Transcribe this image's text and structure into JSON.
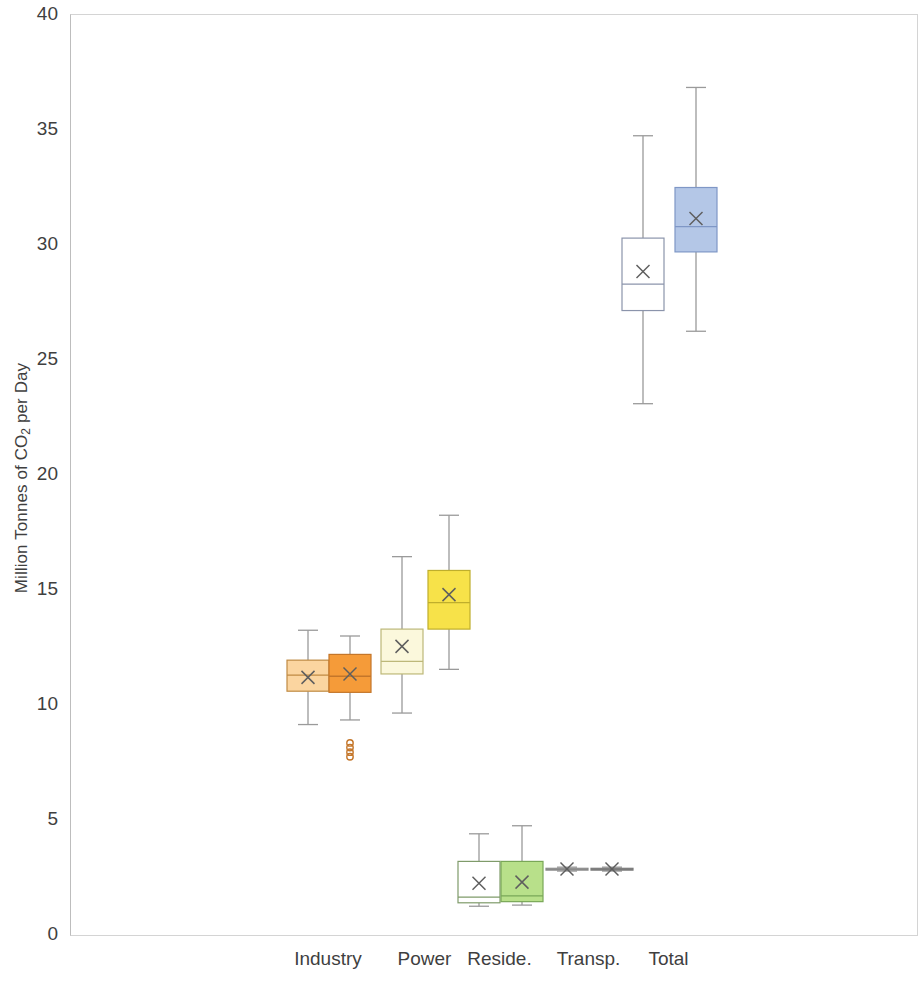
{
  "chart_data": {
    "type": "box",
    "title": "",
    "xlabel": "",
    "ylabel": "Million Tonnes of CO2 per Day",
    "ylabel_parts": {
      "pre": "Million Tonnes of CO",
      "sub": "2",
      "post": " per Day"
    },
    "ylim": [
      0,
      40
    ],
    "ytick_step": 5,
    "yticks": [
      0,
      5,
      10,
      15,
      20,
      25,
      30,
      35,
      40
    ],
    "grid": false,
    "categories": [
      "Industry",
      "Power",
      "Reside.",
      "Transp.",
      "Total"
    ],
    "series": [
      {
        "name": "series-1",
        "color": "#fbd5a0",
        "edge": "#c99a4f"
      },
      {
        "name": "series-2",
        "color": "#f59b39",
        "edge": "#c97b20"
      }
    ],
    "boxes": [
      {
        "category": "Industry",
        "series": 1,
        "fill": "#fbd5a0",
        "edge": "#c08a43",
        "whisker_high": 13.25,
        "q3": 11.95,
        "median": 11.3,
        "mean": 11.2,
        "q1": 10.6,
        "whisker_low": 9.15,
        "outliers": []
      },
      {
        "category": "Industry",
        "series": 2,
        "fill": "#f59b39",
        "edge": "#c4762a",
        "whisker_high": 13.0,
        "q3": 12.2,
        "median": 11.25,
        "mean": 11.35,
        "q1": 10.55,
        "whisker_low": 9.35,
        "outliers": [
          8.35,
          8.15,
          7.95,
          7.75
        ]
      },
      {
        "category": "Power",
        "series": 1,
        "fill": "#fbf8dc",
        "edge": "#bdb879",
        "whisker_high": 16.45,
        "q3": 13.3,
        "median": 11.9,
        "mean": 12.55,
        "q1": 11.35,
        "whisker_low": 9.65,
        "outliers": []
      },
      {
        "category": "Power",
        "series": 2,
        "fill": "#f7e249",
        "edge": "#bfae2c",
        "whisker_high": 18.25,
        "q3": 15.85,
        "median": 14.45,
        "mean": 14.8,
        "q1": 13.3,
        "whisker_low": 11.55,
        "outliers": []
      },
      {
        "category": "Reside.",
        "series": 1,
        "fill": "#ffffff",
        "edge": "#7f9b6a",
        "whisker_high": 4.4,
        "q3": 3.2,
        "median": 1.65,
        "mean": 2.25,
        "q1": 1.4,
        "whisker_low": 1.25,
        "outliers": []
      },
      {
        "category": "Reside.",
        "series": 2,
        "fill": "#b8e08a",
        "edge": "#79a757",
        "whisker_high": 4.75,
        "q3": 3.2,
        "median": 1.7,
        "mean": 2.3,
        "q1": 1.45,
        "whisker_low": 1.3,
        "outliers": []
      },
      {
        "category": "Transp.",
        "series": 1,
        "fill": "#ffffff",
        "edge": "#8a8a8a",
        "whisker_high": 2.95,
        "q3": 2.9,
        "median": 2.85,
        "mean": 2.87,
        "q1": 2.82,
        "whisker_low": 2.78,
        "outliers": []
      },
      {
        "category": "Transp.",
        "series": 2,
        "fill": "#9c9c9c",
        "edge": "#7b7b7b",
        "whisker_high": 2.95,
        "q3": 2.9,
        "median": 2.85,
        "mean": 2.87,
        "q1": 2.82,
        "whisker_low": 2.78,
        "outliers": []
      },
      {
        "category": "Total",
        "series": 1,
        "fill": "#ffffff",
        "edge": "#8b94ab",
        "whisker_high": 34.75,
        "q3": 30.3,
        "median": 28.3,
        "mean": 28.85,
        "q1": 27.15,
        "whisker_low": 23.1,
        "outliers": []
      },
      {
        "category": "Total",
        "series": 2,
        "fill": "#b4c7e7",
        "edge": "#7f97c6",
        "whisker_high": 36.85,
        "q3": 32.5,
        "median": 30.8,
        "mean": 31.15,
        "q1": 29.7,
        "whisker_low": 26.25,
        "outliers": []
      }
    ],
    "box_centers_px": [
      307,
      349,
      401,
      448,
      478,
      521,
      566,
      611,
      642,
      695
    ],
    "box_width_px": 42,
    "axis_color": "#808080",
    "plot_border_color": "#d4d4d4"
  }
}
